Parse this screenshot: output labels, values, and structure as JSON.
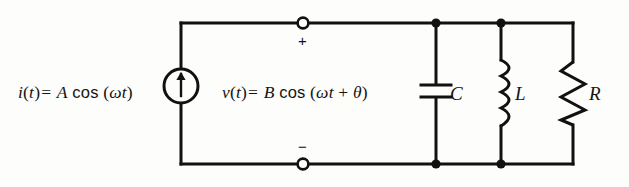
{
  "figure": {
    "kind": "circuit-schematic",
    "background_color": "#fdfdfb",
    "line_color": "#111111"
  },
  "source": {
    "type": "ac-current-source",
    "symbol": "circle-with-up-arrow",
    "expression": {
      "lhs_var": "i",
      "arg": "t",
      "equals": "=",
      "amplitude": "A",
      "function": "cos",
      "open_paren": "(",
      "omega": "ω",
      "time": "t",
      "close_paren": ")"
    },
    "expression_text": "i(t) = A cos (ωt)"
  },
  "port": {
    "voltage_expression": {
      "lhs_var": "v",
      "arg": "t",
      "equals": "=",
      "amplitude": "B",
      "function": "cos",
      "open_paren": "(",
      "omega": "ω",
      "time": "t",
      "plus": "+",
      "theta": "θ",
      "close_paren": ")"
    },
    "voltage_expression_text": "v(t) = B cos (ωt + θ)",
    "positive_terminal_mark": "+",
    "negative_terminal_mark": "−",
    "terminal_style": "open-circle"
  },
  "components": [
    {
      "id": "capacitor",
      "label": "C",
      "symbol": "capacitor",
      "branch": "parallel"
    },
    {
      "id": "inductor",
      "label": "L",
      "symbol": "inductor",
      "branch": "parallel"
    },
    {
      "id": "resistor",
      "label": "R",
      "symbol": "resistor",
      "branch": "parallel"
    }
  ],
  "nodes": {
    "junction_dot_count": 4,
    "open_terminal_count": 2
  }
}
